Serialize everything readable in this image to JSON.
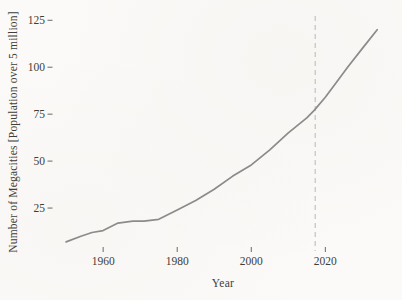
{
  "chart_data": {
    "type": "line",
    "title": "",
    "xlabel": "Year",
    "ylabel": "Number of Megacities [Population over 5 million]",
    "x": [
      1950,
      1954,
      1957,
      1960,
      1964,
      1968,
      1971,
      1975,
      1980,
      1985,
      1990,
      1995,
      2000,
      2005,
      2010,
      2015,
      2017,
      2020,
      2023,
      2026,
      2030,
      2034
    ],
    "series": [
      {
        "name": "Number of megacities",
        "values": [
          7,
          10,
          12,
          13,
          17,
          18,
          18,
          19,
          24,
          29,
          35,
          42,
          48,
          56,
          65,
          73,
          77,
          84,
          92,
          100,
          110,
          120
        ]
      }
    ],
    "xticks": [
      1960,
      1980,
      2000,
      2020
    ],
    "yticks": [
      25,
      50,
      75,
      100,
      125
    ],
    "xlim": [
      1947,
      2038
    ],
    "ylim": [
      0,
      131
    ],
    "grid": false,
    "legend": "none",
    "vline": {
      "x": 2017,
      "style": "dashed",
      "label": ""
    },
    "colors": {
      "line": "#8b8b8b",
      "vline": "#c7c7c7",
      "text": "#403e38",
      "tick": "#6b6963",
      "background": "#fbfaf8"
    }
  }
}
